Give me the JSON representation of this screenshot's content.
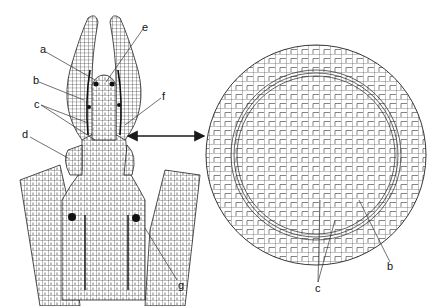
{
  "figure": {
    "left_panel": {
      "name": "longitudinal-section",
      "labels": [
        {
          "id": "a",
          "text": "a",
          "x": 40,
          "y": 44
        },
        {
          "id": "b",
          "text": "b",
          "x": 33,
          "y": 75
        },
        {
          "id": "c",
          "text": "c",
          "x": 34,
          "y": 99
        },
        {
          "id": "d",
          "text": "d",
          "x": 22,
          "y": 129
        },
        {
          "id": "e",
          "text": "e",
          "x": 142,
          "y": 22
        },
        {
          "id": "f",
          "text": "f",
          "x": 162,
          "y": 91
        },
        {
          "id": "g",
          "text": "g",
          "x": 178,
          "y": 280
        }
      ]
    },
    "right_panel": {
      "name": "transverse-section",
      "labels": [
        {
          "id": "b",
          "text": "b",
          "x": 387,
          "y": 261
        },
        {
          "id": "c",
          "text": "c",
          "x": 319,
          "y": 276
        }
      ]
    },
    "arrow": {
      "x1": 126,
      "x2": 206,
      "y": 136
    },
    "colors": {
      "ink": "#1a1a1a",
      "paper": "#ffffff"
    }
  }
}
